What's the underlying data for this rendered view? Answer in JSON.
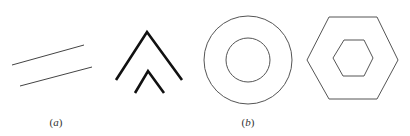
{
  "figure": {
    "stroke_colors": {
      "thin_line": "#444444",
      "thick_line": "#111111",
      "circle": "#555555",
      "hexagon": "#555555"
    },
    "panels": [
      {
        "id": "a",
        "label_open": "(",
        "label_letter": "a",
        "label_close": ")",
        "shapes": [
          {
            "type": "parallel-lines",
            "lines": [
              [
                12,
                65,
                84,
                45
              ],
              [
                20,
                86,
                92,
                67
              ]
            ]
          },
          {
            "type": "nested-chevrons",
            "outer": [
              [
                116,
                80
              ],
              [
                147,
                32
              ],
              [
                182,
                80
              ]
            ],
            "inner": [
              [
                135,
                93
              ],
              [
                148,
                71
              ],
              [
                164,
                93
              ]
            ]
          }
        ]
      },
      {
        "id": "b",
        "label_open": "(",
        "label_letter": "b",
        "label_close": ")",
        "shapes": [
          {
            "type": "concentric-circles",
            "cx": 248,
            "cy": 60,
            "r_outer": 44,
            "r_inner": 22
          },
          {
            "type": "concentric-hexagons",
            "outer": [
              [
                307,
                60
              ],
              [
                329,
                17
              ],
              [
                377,
                17
              ],
              [
                398,
                60
              ],
              [
                377,
                99
              ],
              [
                329,
                99
              ]
            ],
            "inner": [
              [
                333,
                58
              ],
              [
                344,
                40
              ],
              [
                364,
                40
              ],
              [
                373,
                58
              ],
              [
                364,
                76
              ],
              [
                343,
                76
              ]
            ]
          }
        ]
      }
    ]
  }
}
